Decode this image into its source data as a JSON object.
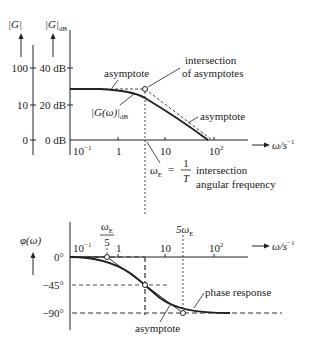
{
  "magnitude_plot": {
    "axis_abs_label": "|G|",
    "axis_db_label": "|G|",
    "axis_db_subscript": "dB",
    "abs_ticks": [
      "100",
      "10",
      "0"
    ],
    "db_ticks": [
      "40 dB",
      "20 dB",
      "0 dB"
    ],
    "x_ticks": [
      "10",
      "1",
      "10",
      "10"
    ],
    "x_tick_exponents": [
      "−1",
      "",
      "",
      "2"
    ],
    "x_axis_label": "ω/s",
    "x_axis_label_exp": "−1",
    "annotations": {
      "asymptote_low": "asymptote",
      "intersection_line1": "intersection",
      "intersection_line2": "of asymptotes",
      "curve_label": "|G(ω)|",
      "curve_label_sub": "dB",
      "asymptote_high": "asymptote",
      "omega_e": "ω",
      "omega_e_sub": "E",
      "equals": "=",
      "frac_num": "1",
      "frac_den": "T",
      "freq_line1": "intersection",
      "freq_line2": "angular frequency"
    }
  },
  "phase_plot": {
    "axis_label": "φ(ω)",
    "y_ticks": [
      "0°",
      "−45°",
      "−90°"
    ],
    "x_ticks": [
      "10",
      "1",
      "10",
      "10"
    ],
    "x_tick_exponents": [
      "−1",
      "",
      "",
      "2"
    ],
    "x_axis_label": "ω/s",
    "x_axis_label_exp": "−1",
    "annotations": {
      "omega_e_over_5_num": "ω",
      "omega_e_over_5_sub": "E",
      "omega_e_over_5_den": "5",
      "five_omega_e": "5ω",
      "five_omega_e_sub": "E",
      "phase_response": "phase response",
      "asymptote": "asymptote"
    }
  },
  "colors": {
    "line": "#222222",
    "dashed": "#333333",
    "background": "#ffffff"
  }
}
